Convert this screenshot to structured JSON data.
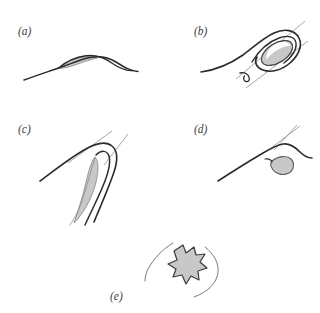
{
  "figure": {
    "background_color": "#ffffff",
    "stroke_color": "#2b2b2b",
    "light_stroke_color": "#9a9a9a",
    "fill_color": "#c8c8c8",
    "fill_stroke_color": "#6e6e6e",
    "panel_count": 5
  },
  "panels": {
    "a": {
      "label": "(a)",
      "label_x": 18,
      "label_y": 35,
      "description": "s-shaped-curve-with-thin-lens-sliver",
      "shaded_region": "thin-lens",
      "tangent_lines": 0
    },
    "b": {
      "label": "(b)",
      "label_x": 194,
      "label_y": 35,
      "description": "curve-loop-with-inner-ellipse",
      "shaded_region": "ellipse",
      "tangent_lines": 2
    },
    "c": {
      "label": "(c)",
      "label_x": 18,
      "label_y": 133,
      "description": "cusp-hook-curve-with-crescent-sliver",
      "shaded_region": "crescent",
      "tangent_lines": 2
    },
    "d": {
      "label": "(d)",
      "label_x": 194,
      "label_y": 133,
      "description": "arched-curve-with-teardrop-blob",
      "shaded_region": "teardrop",
      "tangent_lines": 2
    },
    "e": {
      "label": "(e)",
      "label_x": 110,
      "label_y": 300,
      "description": "star-burst-polygon-between-two-arcs",
      "shaded_region": "star-burst",
      "tangent_lines": 0
    }
  }
}
